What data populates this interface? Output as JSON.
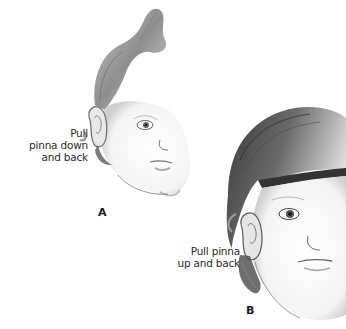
{
  "figure": {
    "panel_a": {
      "letter": "A",
      "instruction_lines": [
        "Pull",
        "pinna down",
        "and back"
      ],
      "subject": "toddler-head-profile-with-tuft"
    },
    "panel_b": {
      "letter": "B",
      "instruction_lines": [
        "Pull pinna",
        "up and back"
      ],
      "subject": "child-head-profile-with-bangs"
    },
    "arrow_color": "#9a9a9a",
    "ink_color": "#555555"
  }
}
